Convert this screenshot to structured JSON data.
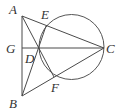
{
  "diagram": {
    "type": "geometry",
    "points": {
      "A": {
        "label": "A",
        "x": 22,
        "y": 16,
        "lx": 9,
        "ly": 14
      },
      "B": {
        "label": "B",
        "x": 22,
        "y": 96,
        "lx": 9,
        "ly": 108
      },
      "C": {
        "label": "C",
        "x": 104,
        "y": 48,
        "lx": 106,
        "ly": 53
      },
      "D": {
        "label": "D",
        "x": 39,
        "y": 48,
        "lx": 24,
        "ly": 63
      },
      "E": {
        "label": "E",
        "x": 46,
        "y": 26,
        "lx": 41,
        "ly": 19
      },
      "F": {
        "label": "F",
        "x": 54,
        "y": 77,
        "lx": 51,
        "ly": 92
      },
      "G": {
        "label": "G",
        "x": 22,
        "y": 48,
        "lx": 6,
        "ly": 53
      }
    },
    "segments": [
      "AB",
      "AC",
      "BC",
      "GC",
      "AF",
      "BE"
    ],
    "circle": {
      "cx": 71.5,
      "cy": 47,
      "r": 32.5,
      "through": [
        "C",
        "D",
        "E",
        "F"
      ]
    },
    "colors": {
      "line": "#4a4a4a",
      "label": "#333333",
      "background": "#ffffff"
    }
  }
}
